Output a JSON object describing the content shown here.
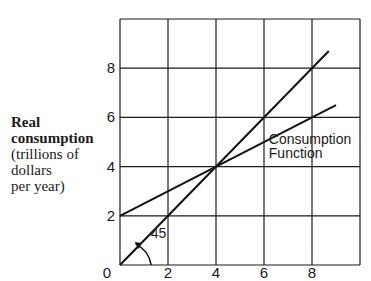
{
  "chart_data": {
    "type": "line",
    "title": "",
    "xlabel": "",
    "ylabel": {
      "bold_lines": [
        "Real",
        "consumption"
      ],
      "normal_lines": [
        "(trillions of",
        "dollars",
        "per year)"
      ]
    },
    "xlim": [
      0,
      10
    ],
    "ylim": [
      0,
      10
    ],
    "grid": true,
    "x_ticks": [
      0,
      2,
      4,
      6,
      8
    ],
    "x_tick_labels": [
      "2",
      "4",
      "6",
      "8"
    ],
    "y_tick_labels": [
      "2",
      "4",
      "6",
      "8"
    ],
    "y_ticks": [
      2,
      4,
      6,
      8
    ],
    "origin_label": "0",
    "series": [
      {
        "name": "45-degree line",
        "x": [
          0,
          8.7
        ],
        "y": [
          0,
          8.7
        ]
      },
      {
        "name": "Consumption Function",
        "x": [
          0,
          9
        ],
        "y": [
          2,
          6.5
        ]
      }
    ],
    "annotations": [
      {
        "text": "Consumption",
        "x": 6.2,
        "y": 4.9
      },
      {
        "text": "Function",
        "x": 6.2,
        "y": 4.35
      },
      {
        "text": "45",
        "x": 1.2,
        "y": 1.3,
        "arrow": true
      }
    ],
    "intersection": {
      "x": 4,
      "y": 4
    }
  }
}
